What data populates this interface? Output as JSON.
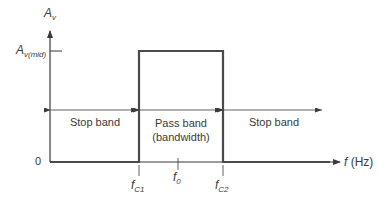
{
  "diagram": {
    "type": "band-pass filter frequency response",
    "y_axis": {
      "label_main": "A",
      "label_sub": "v"
    },
    "x_axis": {
      "label_main": "f",
      "label_unit": " (Hz)"
    },
    "levels": {
      "mid_main": "A",
      "mid_sub": "v(mid)",
      "zero": "0"
    },
    "frequencies": {
      "fc1_main": "f",
      "fc1_sub": "C1",
      "f0_main": "f",
      "f0_sub": "0",
      "fc2_main": "f",
      "fc2_sub": "C2"
    },
    "regions": {
      "stop_left": "Stop band",
      "pass_line1": "Pass band",
      "pass_line2": "(bandwidth)",
      "stop_right": "Stop band"
    },
    "colors": {
      "line": "#3a3a3a",
      "response": "#4a4a4a"
    }
  }
}
